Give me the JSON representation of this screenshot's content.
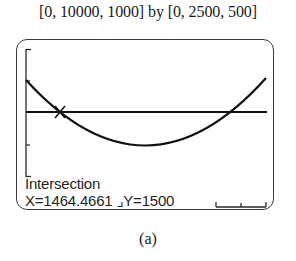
{
  "window": {
    "caption": "[0, 10000, 1000] by [0, 2500, 500]",
    "xmin": 0,
    "xmax": 10000,
    "xscl": 1000,
    "ymin": 0,
    "ymax": 2500,
    "yscl": 500
  },
  "screen": {
    "mode": "Intersection",
    "readout_title": "Intersection",
    "x_label": "X=",
    "x_value": "1464.4661",
    "y_label": "Y=",
    "y_value": "1500",
    "coords_text": "X=1464.4661 ⌟Y=1500"
  },
  "graph": {
    "curve": "parabola",
    "horizontal_line_y": 1500,
    "intersection": {
      "x": 1464.4661,
      "y": 1500
    },
    "colors": {
      "curve": "#111111",
      "frame": "#3a3a3a",
      "background": "#ffffff"
    }
  },
  "figure_label": "(a)"
}
